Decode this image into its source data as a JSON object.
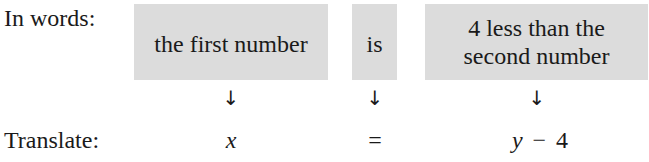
{
  "labels": {
    "in_words": "In words:",
    "translate": "Translate:"
  },
  "phrases": [
    {
      "text": "the first number"
    },
    {
      "text": "is"
    },
    {
      "line1": "4 less than the",
      "line2": "second number"
    }
  ],
  "arrow_glyph": "↓",
  "translation": {
    "var_x": "x",
    "equals": "=",
    "var_y": "y",
    "minus": "−",
    "four": "4"
  },
  "colors": {
    "box_fill": "#dcdcdc",
    "text": "#1a1a1a"
  }
}
